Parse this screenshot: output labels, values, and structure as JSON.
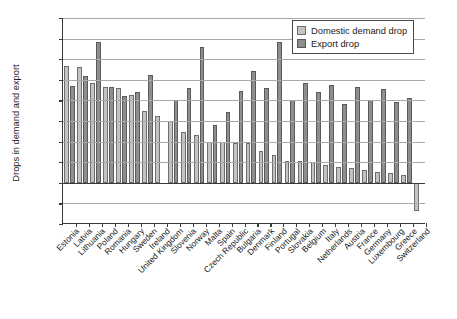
{
  "chart_data": {
    "type": "bar",
    "title": "",
    "xlabel": "",
    "ylabel": "Drops in demand and export",
    "ylim": [
      -0.1,
      0.4
    ],
    "ytick_step": 0.05,
    "ytick_labels": [
      "0.40",
      "0.35",
      "0.30",
      "0.25",
      "0.20",
      "0.15",
      "0.10",
      "0.05",
      "0.00",
      "-0.05",
      "-0.10"
    ],
    "ytick_values": [
      0.4,
      0.35,
      0.3,
      0.25,
      0.2,
      0.15,
      0.1,
      0.05,
      0.0,
      -0.05,
      -0.1
    ],
    "grid": true,
    "legend_position": "top-right",
    "categories": [
      "Estonia",
      "Latvia",
      "Lithuania",
      "Poland",
      "Romania",
      "Hungary",
      "Sweden",
      "Ireland",
      "United Kingdom",
      "Slovenia",
      "Norway",
      "Malta",
      "Spain",
      "Czech Republic",
      "Bulgaria",
      "Denmark",
      "Finland",
      "Portugal",
      "Slovakia",
      "Belgium",
      "Italy",
      "Netherlands",
      "Austria",
      "France",
      "Germany",
      "Luxembourg",
      "Greece",
      "Switzerland"
    ],
    "series": [
      {
        "name": "Domestic demand drop",
        "color": "#c3c3c3",
        "values": [
          0.283,
          0.282,
          0.242,
          0.232,
          0.229,
          0.213,
          0.175,
          0.161,
          0.15,
          0.124,
          0.116,
          0.1,
          0.098,
          0.097,
          0.096,
          0.076,
          0.068,
          0.053,
          0.053,
          0.05,
          0.043,
          0.039,
          0.035,
          0.032,
          0.027,
          0.023,
          0.018,
          -0.068
        ]
      },
      {
        "name": "Export drop",
        "color": "#8e8e8e",
        "values": [
          0.234,
          0.26,
          0.341,
          0.232,
          0.21,
          0.221,
          0.261,
          null,
          0.2,
          0.231,
          0.33,
          0.141,
          0.171,
          0.222,
          0.271,
          0.231,
          0.342,
          0.202,
          0.242,
          0.22,
          0.238,
          0.192,
          0.232,
          0.202,
          0.228,
          0.197,
          0.205,
          null
        ]
      }
    ]
  },
  "legend": {
    "items": [
      {
        "label": "Domestic demand drop",
        "swatch": "dom"
      },
      {
        "label": "Export drop",
        "swatch": "exp"
      }
    ]
  }
}
